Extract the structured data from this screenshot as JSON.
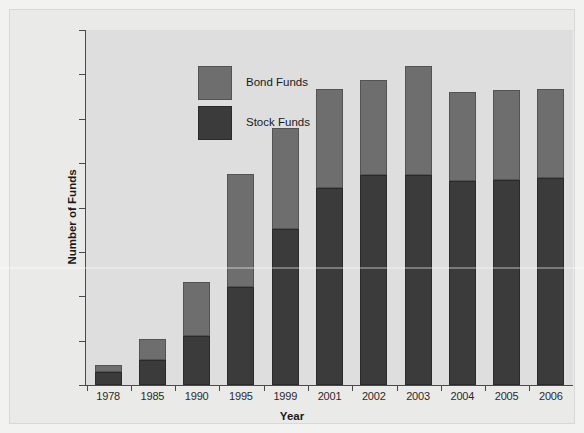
{
  "chart_data": {
    "type": "bar",
    "subtype": "stacked-vertical",
    "title": "",
    "xlabel": "Year",
    "ylabel": "Number of Funds",
    "categories": [
      "1978",
      "1985",
      "1990",
      "1995",
      "1999",
      "2001",
      "2002",
      "2003",
      "2004",
      "2005",
      "2006"
    ],
    "series": [
      {
        "name": "Stock Funds",
        "color": "#3b3b3b",
        "values": [
          300,
          570,
          1100,
          2200,
          3520,
          4430,
          4730,
          4730,
          4600,
          4630,
          4660
        ]
      },
      {
        "name": "Bond Funds",
        "color": "#6e6e6e",
        "values": [
          140,
          460,
          1230,
          2560,
          2270,
          2230,
          2150,
          2470,
          2000,
          2020,
          2020
        ]
      }
    ],
    "totals": [
      440,
      1030,
      2330,
      4760,
      5790,
      6660,
      6880,
      7200,
      6600,
      6650,
      6680
    ],
    "ylim": [
      0,
      8000
    ],
    "yticks": [
      0,
      1000,
      2000,
      3000,
      4000,
      5000,
      6000,
      7000,
      8000
    ],
    "ytick_labels": [
      "0",
      "1000",
      "2000",
      "3000",
      "4000",
      "5000",
      "6000",
      "7000",
      "8000"
    ],
    "grid": false,
    "legend_position": "upper-left",
    "legend_entries": [
      "Bond Funds",
      "Stock Funds"
    ]
  },
  "axes": {
    "y_title": "Number of Funds",
    "x_title": "Year"
  },
  "legend": {
    "items": [
      {
        "label": "Bond Funds",
        "swatch": "bond"
      },
      {
        "label": "Stock Funds",
        "swatch": "stock"
      }
    ]
  },
  "colors": {
    "stock": "#3b3b3b",
    "bond": "#6e6e6e",
    "plot_background": "#dedede",
    "figure_background": "#eaeae8",
    "axis": "#4a4a4a"
  }
}
